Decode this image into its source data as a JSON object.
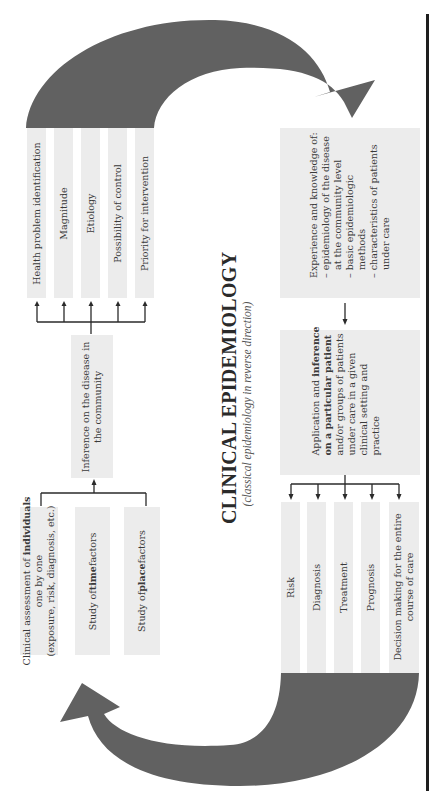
{
  "title": {
    "main": "CLINICAL EPIDEMIOLOGY",
    "subtitle": "(classical epidemiology in reverse direction)"
  },
  "colors": {
    "arrow_fill": "#616161",
    "box_fill": "#ececec",
    "connector": "#2a2a2a",
    "border_line": "#1e1e1e"
  },
  "community_outcomes": [
    {
      "label": "Health problem identification"
    },
    {
      "label": "Magnitude"
    },
    {
      "label": "Etiology"
    },
    {
      "label": "Possibility of control"
    },
    {
      "label": "Priority for intervention"
    }
  ],
  "community_inference": {
    "line1": "Inference on the disease in",
    "line2": "the community"
  },
  "individual_inputs": {
    "clinical": {
      "line1_pre": "Clinical assessment of ",
      "line1_bold": "individuals",
      "line2": "one by one",
      "line3": "(exposure, risk, diagnosis, etc.)"
    },
    "time": {
      "pre": "Study of ",
      "bold": "time",
      "post": " factors"
    },
    "place": {
      "pre": "Study of ",
      "bold": "place",
      "post": " factors"
    }
  },
  "experience": {
    "heading": "Experience and knowledge of:",
    "items": [
      {
        "line1": "– epidemiology of the disease",
        "line2": "at the community level"
      },
      {
        "line1": "– basic epidemiologic",
        "line2": "methods"
      },
      {
        "line1": "– characteristics of patients",
        "line2": "under care"
      }
    ]
  },
  "application": {
    "l1_pre": "Application and ",
    "l1_bold": "inference",
    "l2_bold_a": "on a particular ",
    "l2_bold_b": "patient",
    "l3": "and/or groups of patients",
    "l4": "under care in a given",
    "l5": "clinical setting and",
    "l6": "practice"
  },
  "clinical_outcomes": [
    {
      "label": "Risk"
    },
    {
      "label": "Diagnosis"
    },
    {
      "label": "Treatment"
    },
    {
      "label": "Prognosis"
    },
    {
      "label": "Decision making for the entire",
      "label2": "course of care"
    }
  ]
}
